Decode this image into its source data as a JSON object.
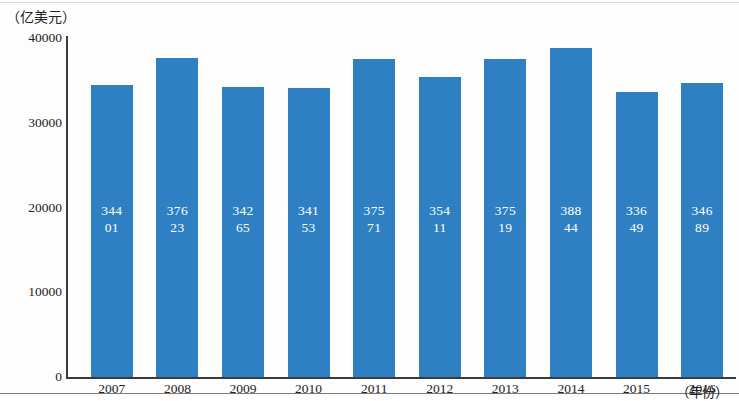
{
  "chart_data": {
    "type": "bar",
    "title": "",
    "subtitle": "",
    "xlabel": "（年份）",
    "ylabel": "（亿美元）",
    "categories": [
      "2007",
      "2008",
      "2009",
      "2010",
      "2011",
      "2012",
      "2013",
      "2014",
      "2015",
      "2016"
    ],
    "values": [
      34401,
      37623,
      34265,
      34153,
      37571,
      35411,
      37519,
      38844,
      33649,
      34689
    ],
    "value_labels": [
      [
        "344",
        "01"
      ],
      [
        "376",
        "23"
      ],
      [
        "342",
        "65"
      ],
      [
        "341",
        "53"
      ],
      [
        "375",
        "71"
      ],
      [
        "354",
        "11"
      ],
      [
        "375",
        "19"
      ],
      [
        "388",
        "44"
      ],
      [
        "336",
        "49"
      ],
      [
        "346",
        "89"
      ]
    ],
    "ylim": [
      0,
      40000
    ],
    "yticks": [
      "0",
      "10000",
      "20000",
      "30000",
      "40000"
    ],
    "ytick_values": [
      0,
      10000,
      20000,
      30000,
      40000
    ],
    "grid": false,
    "legend": "none",
    "series": [
      {
        "name": "",
        "values": [
          34401,
          37623,
          34265,
          34153,
          37571,
          35411,
          37519,
          38844,
          33649,
          34689
        ]
      }
    ],
    "colors": {
      "bar": "#2f80c2",
      "label_text": "#ffffff",
      "axis": "#3b3b3b",
      "tick_text": "#232323",
      "background": "#fdfdfd"
    }
  }
}
